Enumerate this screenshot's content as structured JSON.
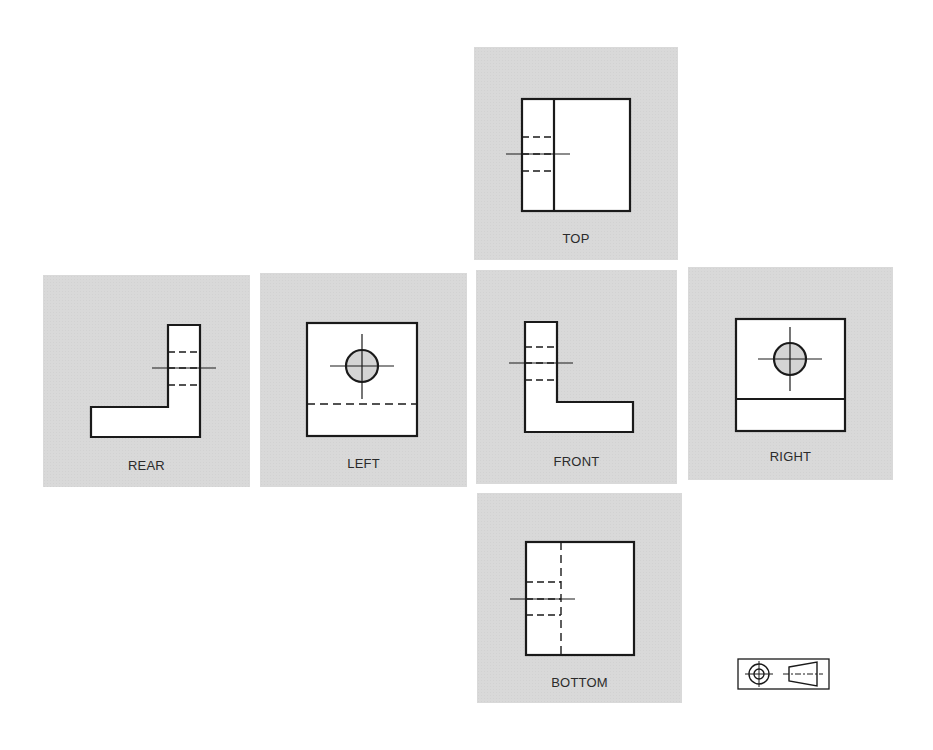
{
  "figure": {
    "panel_background": "#d9d9d9",
    "line_color": "#1a1a1a",
    "views": {
      "top": {
        "label": "TOP"
      },
      "rear": {
        "label": "REAR"
      },
      "left": {
        "label": "LEFT"
      },
      "front": {
        "label": "FRONT"
      },
      "right": {
        "label": "RIGHT"
      },
      "bottom": {
        "label": "BOTTOM"
      }
    },
    "projection_symbol": {
      "type": "third-angle-projection-symbol"
    }
  }
}
